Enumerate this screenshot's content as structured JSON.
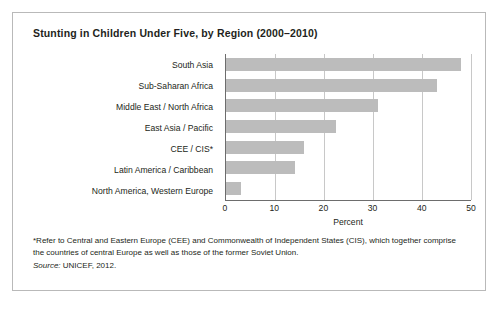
{
  "chart_data": {
    "type": "bar",
    "orientation": "horizontal",
    "title": "Stunting in Children Under Five, by Region (2000–2010)",
    "xlabel": "Percent",
    "ylabel": "",
    "xlim": [
      0,
      50
    ],
    "xticks": [
      0,
      10,
      20,
      30,
      40,
      50
    ],
    "xtick_labels": [
      "0",
      "10",
      "20",
      "30",
      "40",
      "50"
    ],
    "grid": true,
    "grid_axis": "x",
    "legend": false,
    "bar_color": "#bcbcbc",
    "categories": [
      "South Asia",
      "Sub-Saharan Africa",
      "Middle East / North Africa",
      "East Asia / Pacific",
      "CEE / CIS*",
      "Latin America / Caribbean",
      "North America, Western Europe"
    ],
    "values": [
      48,
      43,
      31,
      22.5,
      16,
      14,
      3
    ]
  },
  "notes": {
    "footnote": "*Refer to Central and Eastern Europe (CEE) and Commonwealth of Independent States (CIS), which together comprise the countries of central Europe as well as those of the former Soviet Union.",
    "source_label": "Source:",
    "source_value": "UNICEF, 2012."
  }
}
